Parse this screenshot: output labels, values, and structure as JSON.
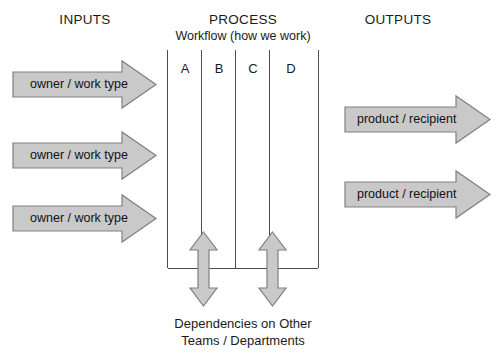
{
  "diagram": {
    "title_columns": {
      "inputs": "INPUTS",
      "process": "PROCESS",
      "process_subtitle": "Workflow (how we work)",
      "outputs": "OUTPUTS"
    },
    "inputs": {
      "arrows": [
        {
          "label": "owner / work type"
        },
        {
          "label": "owner / work type"
        },
        {
          "label": "owner / work type"
        }
      ]
    },
    "process": {
      "lanes": [
        {
          "label": "A"
        },
        {
          "label": "B"
        },
        {
          "label": "C"
        },
        {
          "label": "D"
        }
      ],
      "dependency_arrows": [
        {
          "name": "dependency-arrow-1"
        },
        {
          "name": "dependency-arrow-2"
        }
      ]
    },
    "outputs": {
      "arrows": [
        {
          "label": "product / recipient"
        },
        {
          "label": "product / recipient"
        }
      ]
    },
    "caption": {
      "line1": "Dependencies on Other",
      "line2": "Teams / Departments"
    },
    "colors": {
      "arrow_fill": "#c9c9c9",
      "arrow_stroke": "#808080",
      "line": "#4d4d4d",
      "text": "#1a1a1a",
      "background": "#ffffff"
    }
  }
}
